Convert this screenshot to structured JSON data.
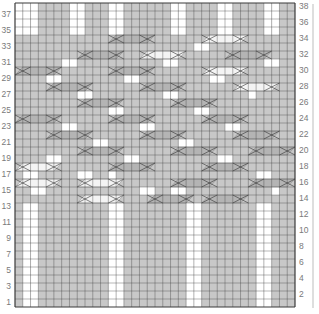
{
  "chart_data": {
    "type": "diagram",
    "title": "",
    "grid": {
      "cols": 36,
      "rows": 38
    },
    "colors": {
      "purl_bg": "#c8c8c8",
      "knit_bg": "#ffffff",
      "grid_line": "#3a3a3a",
      "cable_fill": "#b4b4b4",
      "cable_light": "#f4f4f4",
      "label": "#7a7a7a",
      "bracket": "#bdbdbd"
    },
    "left_row_labels": [
      "1",
      "3",
      "5",
      "7",
      "9",
      "11",
      "13",
      "15",
      "17",
      "19",
      "21",
      "23",
      "25",
      "27",
      "29",
      "31",
      "33",
      "35",
      "37"
    ],
    "right_row_labels": [
      "2",
      "4",
      "6",
      "8",
      "10",
      "12",
      "14",
      "16",
      "18",
      "20",
      "22",
      "24",
      "26",
      "28",
      "30",
      "32",
      "34",
      "36",
      "38"
    ],
    "sections": [
      {
        "rows_from": 1,
        "rows_to": 13,
        "white_cols": [
          2,
          3,
          13,
          14,
          23,
          24,
          32,
          33
        ]
      },
      {
        "rows_from": 35,
        "rows_to": 38,
        "white_cols": [
          1,
          2,
          3,
          8,
          9,
          13,
          14,
          21,
          22,
          27,
          28,
          33,
          34
        ]
      }
    ],
    "white_cells": [
      {
        "row": 33,
        "cols": [
          24,
          25
        ]
      },
      {
        "row": 31,
        "cols": [
          7,
          8,
          20,
          21,
          33,
          34
        ]
      },
      {
        "row": 29,
        "cols": [
          5,
          6,
          15,
          16,
          26,
          27
        ]
      },
      {
        "row": 27,
        "cols": [
          9,
          10,
          20,
          21,
          31
        ]
      },
      {
        "row": 25,
        "cols": [
          13,
          14,
          24,
          25
        ]
      },
      {
        "row": 23,
        "cols": [
          7,
          8,
          17,
          18,
          28,
          29
        ]
      },
      {
        "row": 21,
        "cols": [
          11,
          12,
          22,
          23
        ]
      },
      {
        "row": 19,
        "cols": [
          5,
          6,
          15,
          16,
          27,
          28
        ]
      },
      {
        "row": 17,
        "cols": [
          2,
          3,
          9,
          10,
          13,
          32,
          33
        ]
      },
      {
        "row": 15,
        "cols": [
          3,
          4,
          17,
          18,
          21,
          22,
          34
        ]
      }
    ],
    "cables": [
      {
        "row": 34,
        "col": 13,
        "width": 6,
        "style": "dark"
      },
      {
        "row": 34,
        "col": 25,
        "width": 6,
        "style": "light"
      },
      {
        "row": 32,
        "col": 9,
        "width": 6,
        "style": "dark"
      },
      {
        "row": 32,
        "col": 17,
        "width": 6,
        "style": "light"
      },
      {
        "row": 32,
        "col": 28,
        "width": 6,
        "style": "dark"
      },
      {
        "row": 30,
        "col": 1,
        "width": 6,
        "style": "dark"
      },
      {
        "row": 30,
        "col": 13,
        "width": 6,
        "style": "dark"
      },
      {
        "row": 30,
        "col": 25,
        "width": 6,
        "style": "light"
      },
      {
        "row": 28,
        "col": 5,
        "width": 6,
        "style": "dark"
      },
      {
        "row": 28,
        "col": 17,
        "width": 6,
        "style": "dark"
      },
      {
        "row": 28,
        "col": 29,
        "width": 6,
        "style": "light"
      },
      {
        "row": 26,
        "col": 9,
        "width": 6,
        "style": "dark"
      },
      {
        "row": 26,
        "col": 21,
        "width": 6,
        "style": "dark"
      },
      {
        "row": 24,
        "col": 1,
        "width": 6,
        "style": "dark"
      },
      {
        "row": 24,
        "col": 13,
        "width": 6,
        "style": "dark"
      },
      {
        "row": 24,
        "col": 25,
        "width": 6,
        "style": "dark"
      },
      {
        "row": 22,
        "col": 5,
        "width": 6,
        "style": "dark"
      },
      {
        "row": 22,
        "col": 17,
        "width": 6,
        "style": "dark"
      },
      {
        "row": 22,
        "col": 29,
        "width": 6,
        "style": "dark"
      },
      {
        "row": 20,
        "col": 9,
        "width": 6,
        "style": "dark"
      },
      {
        "row": 20,
        "col": 21,
        "width": 6,
        "style": "dark"
      },
      {
        "row": 20,
        "col": 31,
        "width": 6,
        "style": "dark"
      },
      {
        "row": 18,
        "col": 1,
        "width": 6,
        "style": "light"
      },
      {
        "row": 18,
        "col": 13,
        "width": 6,
        "style": "dark"
      },
      {
        "row": 18,
        "col": 25,
        "width": 6,
        "style": "dark"
      },
      {
        "row": 16,
        "col": 1,
        "width": 6,
        "style": "light"
      },
      {
        "row": 16,
        "col": 9,
        "width": 6,
        "style": "light"
      },
      {
        "row": 16,
        "col": 21,
        "width": 6,
        "style": "dark"
      },
      {
        "row": 16,
        "col": 31,
        "width": 6,
        "style": "dark"
      },
      {
        "row": 14,
        "col": 9,
        "width": 6,
        "style": "light"
      },
      {
        "row": 14,
        "col": 18,
        "width": 6,
        "style": "dark"
      },
      {
        "row": 14,
        "col": 25,
        "width": 6,
        "style": "dark"
      }
    ]
  }
}
